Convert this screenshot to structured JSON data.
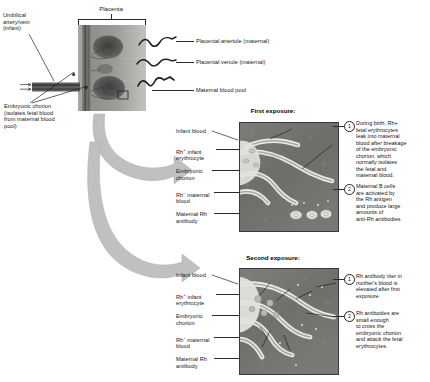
{
  "figure": {
    "topSection": {
      "bracket_label": "Placenta",
      "left_labels": [
        {
          "name": "umbilical-artery-vein",
          "text": "Umbilical\nartery/vein\n(infant)"
        },
        {
          "name": "embryonic-chorion",
          "text": "Embryonic chorion\n(isolates fetal blood\nfrom maternal blood\npool)"
        }
      ],
      "right_labels": [
        {
          "name": "placental-arteriole",
          "text": "Placental arteriole (maternal)"
        },
        {
          "name": "placental-venule",
          "text": "Placental venule (maternal)"
        },
        {
          "name": "maternal-blood-pool",
          "text": "Maternal blood pool"
        }
      ]
    },
    "panels": [
      {
        "id": "first-exposure",
        "title": "First exposure:\nBirth of first Rh+ infant",
        "title_line1": "First exposure:",
        "title_line2_pre": "Birth of first Rh",
        "title_line2_sup": "+",
        "title_line2_post": " infant",
        "labels": [
          {
            "name": "infant-blood",
            "text": "Infant blood"
          },
          {
            "name": "rh-positive-infant-erythrocyte",
            "text": "Rh+ infant\nerythrocyte",
            "pre": "Rh",
            "sup": "+",
            "post": " infant\nerythrocyte"
          },
          {
            "name": "embryonic-chorion",
            "text": "Embryonic\nchorion"
          },
          {
            "name": "rh-negative-maternal-blood",
            "text": "Rh- maternal\nblood",
            "pre": "Rh",
            "sup": "–",
            "post": " maternal\nblood"
          },
          {
            "name": "maternal-rh-antibody",
            "text": "Maternal Rh\nantibody"
          }
        ],
        "callouts": [
          {
            "number": "1",
            "text": "During birth, Rh+\nfetal erythrocytes\nleak into maternal\nblood after breakage\nof the embryonic\nchorion, which\nnormally isolates\nthe fetal and\nmaternal blood."
          },
          {
            "number": "2",
            "text": "Maternal B cells\nare activated by\nthe Rh antigen\nand produce large\namounts of\nanti-Rh antibodies."
          }
        ]
      },
      {
        "id": "second-exposure",
        "title": "Second exposure:\nRh+ fetus",
        "title_line1": "Second exposure:",
        "title_line2_pre": "Rh",
        "title_line2_sup": "+",
        "title_line2_post": " fetus",
        "labels": [
          {
            "name": "infant-blood",
            "text": "Infant blood"
          },
          {
            "name": "rh-positive-infant-erythrocyte",
            "text": "Rh+ infant\nerythrocyte",
            "pre": "Rh",
            "sup": "+",
            "post": " infant\nerythrocyte"
          },
          {
            "name": "embryonic-chorion",
            "text": "Embryonic\nchorion"
          },
          {
            "name": "rh-negative-maternal-blood",
            "text": "Rh- maternal\nblood",
            "pre": "Rh",
            "sup": "–",
            "post": " maternal\nblood"
          },
          {
            "name": "maternal-rh-antibody",
            "text": "Maternal Rh\nantibody"
          }
        ],
        "callouts": [
          {
            "number": "1",
            "text": "Rh antibody titer in\nmother's blood is\nelevated after first\nexposure."
          },
          {
            "number": "2",
            "text": "Rh antibodies are\nsmall enough\nto cross the\nembryonic chorion\nand attack the fetal\nerythrocytes."
          }
        ]
      }
    ],
    "colors": {
      "ink": "#151515",
      "arrow_gray": "#b9b9b9",
      "panel_dark": "#6e6e6e",
      "panel_villus": "#e8e8e4",
      "photo_tissue": "#8d8d8a",
      "photo_dark": "#4a4a48"
    }
  }
}
